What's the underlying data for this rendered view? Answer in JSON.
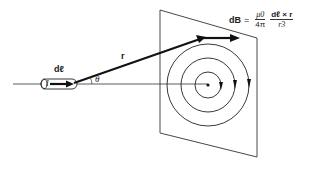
{
  "diagram": {
    "labels": {
      "current_element": "dℓ",
      "current": "I",
      "position_vector": "r",
      "angle": "θ"
    },
    "equation": {
      "lhs": "dB",
      "equals": "=",
      "const_num": "μ0",
      "const_den": "4π",
      "vec_num": "dℓ × r",
      "vec_den": "r3"
    },
    "colors": {
      "line": "#1a1a1a",
      "background": "#ffffff"
    }
  }
}
